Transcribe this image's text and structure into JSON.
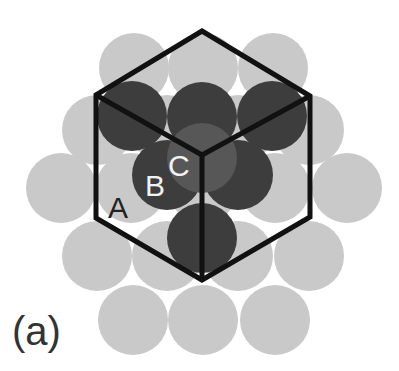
{
  "figure": {
    "panel_label": "(a)",
    "colors": {
      "background": "#ffffff",
      "layer_A": "#c9c9c9",
      "layer_B": "#3d3d3d",
      "layer_C": "#575757",
      "outline": "#111111",
      "label_dark": "#222222",
      "label_light": "#f2f2f2"
    },
    "layer_labels": {
      "A": "A",
      "B": "B",
      "C": "C"
    },
    "sphere_radius": 35,
    "layer_A_spheres": [
      [
        134,
        68
      ],
      [
        203,
        68
      ],
      [
        273,
        68
      ],
      [
        97,
        130
      ],
      [
        167,
        130
      ],
      [
        238,
        130
      ],
      [
        309,
        130
      ],
      [
        61,
        188
      ],
      [
        131,
        188
      ],
      [
        203,
        188
      ],
      [
        275,
        188
      ],
      [
        347,
        188
      ],
      [
        97,
        256
      ],
      [
        167,
        256
      ],
      [
        238,
        256
      ],
      [
        309,
        256
      ],
      [
        133,
        320
      ],
      [
        203,
        320
      ],
      [
        275,
        320
      ]
    ],
    "layer_B_spheres": [
      [
        132,
        116
      ],
      [
        202,
        117
      ],
      [
        272,
        116
      ],
      [
        167,
        175
      ],
      [
        238,
        175
      ],
      [
        202,
        238
      ]
    ],
    "layer_C_spheres": [
      [
        202,
        158
      ]
    ],
    "cube_outline": {
      "top": [
        202,
        31
      ],
      "upper_left": [
        96,
        95
      ],
      "upper_right": [
        310,
        96
      ],
      "lower_left": [
        96,
        218
      ],
      "lower_right": [
        310,
        217
      ],
      "bottom": [
        202,
        280
      ],
      "center": [
        202,
        155
      ]
    }
  }
}
